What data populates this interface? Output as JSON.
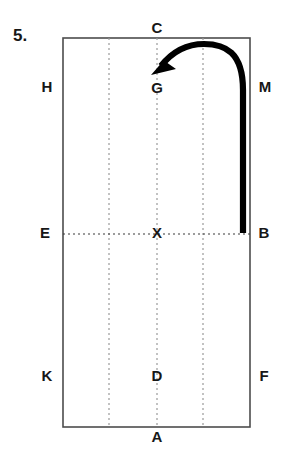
{
  "figure": {
    "number_label": "5.",
    "type": "paper-folding-diagram",
    "canvas": {
      "width": 284,
      "height": 465
    },
    "colors": {
      "background": "#ffffff",
      "outline": "#4d4d4d",
      "dashed_vertical": "#9a9a9a",
      "dashed_horizontal": "#3a3a3a",
      "arrow": "#000000",
      "text": "#171717"
    },
    "rectangle": {
      "left": 63,
      "top": 38,
      "right": 250,
      "bottom": 427
    },
    "dashed_verticals_x": [
      109,
      157,
      203
    ],
    "dashed_horizontal_y": 234,
    "points": [
      {
        "id": "C",
        "label": "C",
        "x": 157,
        "y": 29,
        "position": "top-edge-midpoint-outside"
      },
      {
        "id": "H",
        "label": "H",
        "x": 47,
        "y": 88,
        "position": "left-outside-upper"
      },
      {
        "id": "M",
        "label": "M",
        "x": 265,
        "y": 88,
        "position": "right-outside-upper"
      },
      {
        "id": "G",
        "label": "G",
        "x": 157,
        "y": 89,
        "position": "interior-upper-center"
      },
      {
        "id": "E",
        "label": "E",
        "x": 45,
        "y": 234,
        "position": "left-outside-middle"
      },
      {
        "id": "X",
        "label": "X",
        "x": 157,
        "y": 234,
        "position": "interior-center"
      },
      {
        "id": "B",
        "label": "B",
        "x": 264,
        "y": 234,
        "position": "right-outside-middle"
      },
      {
        "id": "K",
        "label": "K",
        "x": 47,
        "y": 377,
        "position": "left-outside-lower"
      },
      {
        "id": "D",
        "label": "D",
        "x": 157,
        "y": 377,
        "position": "interior-lower-center"
      },
      {
        "id": "F",
        "label": "F",
        "x": 264,
        "y": 377,
        "position": "right-outside-lower"
      },
      {
        "id": "A",
        "label": "A",
        "x": 157,
        "y": 438,
        "position": "bottom-edge-midpoint-outside"
      }
    ],
    "fold_arrow": {
      "description": "thick curved fold arrow from B upward and over, ending pointing down-left at G",
      "tail_point": {
        "x": 243,
        "y": 233
      },
      "tip_point": {
        "x": 152,
        "y": 74
      },
      "path": "M 243 233 L 243 90 C 243 52 225 44 204 44 C 186 44 172 52 161 66",
      "arrowhead_points": "152,74 174,68 164,62 169,53"
    }
  }
}
